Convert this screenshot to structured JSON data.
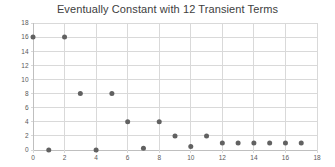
{
  "chart_data": {
    "type": "scatter",
    "title": "Eventually Constant with 12 Transient Terms",
    "x": [
      0,
      1,
      2,
      3,
      4,
      5,
      6,
      7,
      8,
      9,
      10,
      11,
      12,
      13,
      14,
      15,
      16,
      17
    ],
    "y": [
      16,
      0,
      16,
      8,
      0,
      8,
      4,
      0.25,
      4,
      2,
      0.5,
      2,
      1,
      1,
      1,
      1,
      1,
      1
    ],
    "xlabel": "",
    "ylabel": "",
    "xlim": [
      0,
      18
    ],
    "ylim": [
      0,
      18
    ],
    "x_ticks": [
      0,
      2,
      4,
      6,
      8,
      10,
      12,
      14,
      16,
      18
    ],
    "y_ticks": [
      0,
      2,
      4,
      6,
      8,
      10,
      12,
      14,
      16,
      18
    ],
    "grid": true,
    "legend": "none",
    "colors": {
      "marker": "#616161",
      "gridline": "#d9d9d9",
      "axis_line": "#bfbfbf",
      "tick_mark": "#d9d9d9",
      "tick_label": "#595959",
      "title": "#404040",
      "background": "#ffffff"
    }
  }
}
